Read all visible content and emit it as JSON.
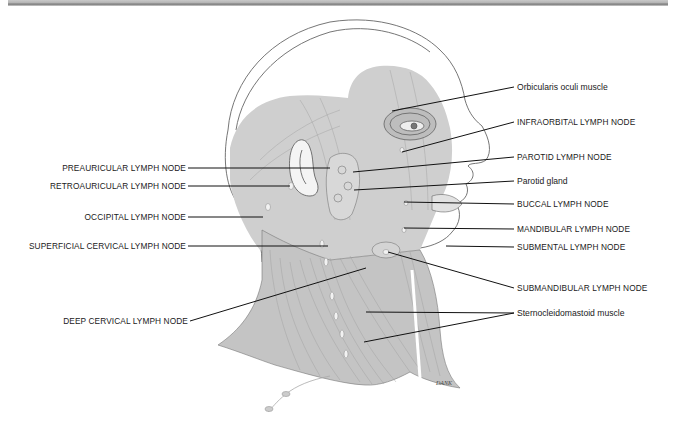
{
  "diagram": {
    "signature": "DANK",
    "colors": {
      "muscle_fill": "#c8c8c8",
      "outline": "#555555",
      "leader_line": "#111111",
      "top_rule": "#8a8a8a"
    },
    "labels_left": [
      {
        "id": "preauricular",
        "text": "PREAURICULAR LYMPH NODE"
      },
      {
        "id": "retroauricular",
        "text": "RETROAURICULAR LYMPH NODE"
      },
      {
        "id": "occipital",
        "text": "OCCIPITAL LYMPH NODE"
      },
      {
        "id": "superficial-cervical",
        "text": "SUPERFICIAL CERVICAL LYMPH NODE"
      },
      {
        "id": "deep-cervical",
        "text": "DEEP CERVICAL LYMPH NODE"
      }
    ],
    "labels_right": [
      {
        "id": "orbicularis-oculi",
        "text": "Orbicularis oculi muscle"
      },
      {
        "id": "infraorbital",
        "text": "INFRAORBITAL LYMPH NODE"
      },
      {
        "id": "parotid-node",
        "text": "PAROTID LYMPH NODE"
      },
      {
        "id": "parotid-gland",
        "text": "Parotid gland"
      },
      {
        "id": "buccal",
        "text": "BUCCAL LYMPH NODE"
      },
      {
        "id": "mandibular",
        "text": "MANDIBULAR LYMPH NODE"
      },
      {
        "id": "submental",
        "text": "SUBMENTAL LYMPH NODE"
      },
      {
        "id": "submandibular",
        "text": "SUBMANDIBULAR LYMPH NODE"
      },
      {
        "id": "sternocleidomastoid",
        "text": "Sternocleidomastoid muscle"
      }
    ]
  }
}
